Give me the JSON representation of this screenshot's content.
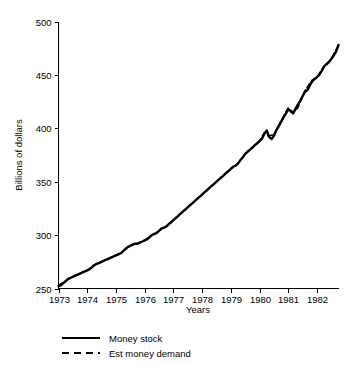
{
  "chart_data": {
    "type": "line",
    "title": "",
    "xlabel": "Years",
    "ylabel": "Billions of dollars",
    "xlim": [
      1973.0,
      1982.75
    ],
    "ylim": [
      250,
      500
    ],
    "grid": false,
    "legend_position": "bottom-left",
    "x_tick_labels": [
      "1973",
      "1974",
      "1975",
      "1976",
      "1977",
      "1978",
      "1979",
      "1980",
      "1981",
      "1982"
    ],
    "x_ticks": [
      1973,
      1974,
      1975,
      1976,
      1977,
      1978,
      1979,
      1980,
      1981,
      1982
    ],
    "y_tick_labels": [
      "250",
      "300",
      "350",
      "400",
      "450",
      "500"
    ],
    "y_ticks": [
      250,
      300,
      350,
      400,
      450,
      500
    ],
    "series": [
      {
        "name": "Money stock",
        "style": "solid",
        "color": "#000000",
        "x": [
          1973.0,
          1973.08,
          1973.17,
          1973.25,
          1973.33,
          1973.42,
          1973.5,
          1973.58,
          1973.67,
          1973.75,
          1973.83,
          1973.92,
          1974.0,
          1974.08,
          1974.17,
          1974.25,
          1974.33,
          1974.42,
          1974.5,
          1974.58,
          1974.67,
          1974.75,
          1974.83,
          1974.92,
          1975.0,
          1975.08,
          1975.17,
          1975.25,
          1975.33,
          1975.42,
          1975.5,
          1975.58,
          1975.67,
          1975.75,
          1975.83,
          1975.92,
          1976.0,
          1976.08,
          1976.17,
          1976.25,
          1976.33,
          1976.42,
          1976.5,
          1976.58,
          1976.67,
          1976.75,
          1976.83,
          1976.92,
          1977.0,
          1977.08,
          1977.17,
          1977.25,
          1977.33,
          1977.42,
          1977.5,
          1977.58,
          1977.67,
          1977.75,
          1977.83,
          1977.92,
          1978.0,
          1978.08,
          1978.17,
          1978.25,
          1978.33,
          1978.42,
          1978.5,
          1978.58,
          1978.67,
          1978.75,
          1978.83,
          1978.92,
          1979.0,
          1979.08,
          1979.17,
          1979.25,
          1979.33,
          1979.42,
          1979.5,
          1979.58,
          1979.67,
          1979.75,
          1979.83,
          1979.92,
          1980.0,
          1980.08,
          1980.17,
          1980.25,
          1980.33,
          1980.42,
          1980.5,
          1980.58,
          1980.67,
          1980.75,
          1980.83,
          1980.92,
          1981.0,
          1981.08,
          1981.17,
          1981.25,
          1981.33,
          1981.42,
          1981.5,
          1981.58,
          1981.67,
          1981.75,
          1981.83,
          1981.92,
          1982.0,
          1982.08,
          1982.17,
          1982.25,
          1982.33,
          1982.42,
          1982.5,
          1982.58,
          1982.67,
          1982.75
        ],
        "values": [
          252,
          253,
          255,
          257,
          259,
          260,
          261,
          262,
          263,
          264,
          265,
          266,
          267,
          268,
          270,
          272,
          273,
          274,
          275,
          276,
          277,
          278,
          279,
          280,
          281,
          282,
          283,
          285,
          287,
          289,
          290,
          291,
          292,
          292,
          293,
          294,
          295,
          296,
          298,
          300,
          301,
          302,
          304,
          306,
          307,
          308,
          310,
          312,
          314,
          316,
          318,
          320,
          322,
          324,
          326,
          328,
          330,
          332,
          334,
          336,
          338,
          340,
          342,
          344,
          346,
          348,
          350,
          352,
          354,
          356,
          358,
          360,
          362,
          364,
          365,
          367,
          370,
          373,
          376,
          378,
          380,
          382,
          384,
          386,
          388,
          390,
          395,
          398,
          392,
          390,
          393,
          398,
          402,
          406,
          410,
          414,
          418,
          416,
          414,
          418,
          422,
          426,
          430,
          434,
          436,
          440,
          444,
          446,
          448,
          450,
          454,
          458,
          460,
          462,
          465,
          468,
          472,
          478
        ]
      },
      {
        "name": "Est money demand",
        "style": "dashed",
        "color": "#000000",
        "x": [
          1973.0,
          1973.25,
          1973.5,
          1973.75,
          1974.0,
          1974.25,
          1974.5,
          1974.75,
          1975.0,
          1975.25,
          1975.5,
          1975.75,
          1976.0,
          1976.25,
          1976.5,
          1976.75,
          1977.0,
          1977.25,
          1977.5,
          1977.75,
          1978.0,
          1978.25,
          1978.5,
          1978.75,
          1979.0,
          1979.25,
          1979.5,
          1979.75,
          1980.0,
          1980.17,
          1980.33,
          1980.5,
          1980.75,
          1981.0,
          1981.17,
          1981.33,
          1981.58,
          1981.83,
          1982.0,
          1982.25,
          1982.5,
          1982.75
        ],
        "values": [
          253,
          257,
          261,
          264,
          267,
          272,
          275,
          278,
          281,
          285,
          290,
          292,
          295,
          300,
          304,
          308,
          314,
          320,
          326,
          332,
          338,
          344,
          350,
          356,
          362,
          367,
          376,
          382,
          388,
          396,
          393,
          394,
          407,
          419,
          415,
          419,
          435,
          445,
          448,
          458,
          465,
          478
        ]
      }
    ]
  },
  "legend": {
    "items": [
      {
        "label": "Money stock",
        "style": "solid"
      },
      {
        "label": "Est money demand",
        "style": "dashed"
      }
    ]
  }
}
